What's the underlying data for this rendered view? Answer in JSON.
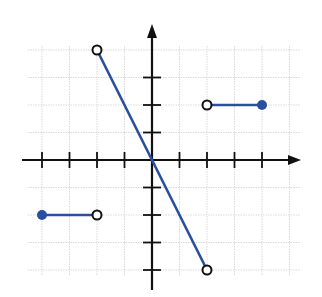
{
  "chart_data": {
    "type": "line",
    "title": "",
    "xlabel": "",
    "ylabel": "",
    "xlim": [
      -4,
      5
    ],
    "ylim": [
      -4,
      4
    ],
    "grid": true,
    "axis_ticks_x": [
      -4,
      -3,
      -2,
      -1,
      1,
      2,
      3,
      4
    ],
    "axis_ticks_y": [
      -4,
      -3,
      -2,
      -1,
      1,
      2,
      3
    ],
    "tick_labels_shown": false,
    "legend": [],
    "series": [
      {
        "name": "piece-1",
        "points": [
          [
            -4,
            -2
          ],
          [
            -2,
            -2
          ]
        ],
        "endpoints": [
          {
            "x": -4,
            "y": -2,
            "style": "closed"
          },
          {
            "x": -2,
            "y": -2,
            "style": "open"
          }
        ]
      },
      {
        "name": "piece-2",
        "points": [
          [
            -2,
            4
          ],
          [
            0,
            0
          ],
          [
            2,
            -4
          ]
        ],
        "endpoints": [
          {
            "x": -2,
            "y": 4,
            "style": "open"
          },
          {
            "x": 2,
            "y": -4,
            "style": "open"
          }
        ]
      },
      {
        "name": "piece-3",
        "points": [
          [
            2,
            2
          ],
          [
            4,
            2
          ]
        ],
        "endpoints": [
          {
            "x": 2,
            "y": 2,
            "style": "open"
          },
          {
            "x": 4,
            "y": 2,
            "style": "closed"
          }
        ]
      }
    ],
    "colors": {
      "line": "#2b4e9e",
      "axis": "#111111",
      "grid": "#d9d9d9",
      "open_point_stroke": "#111111",
      "open_point_fill": "#ffffff",
      "closed_point_fill": "#2b4e9e"
    },
    "layout": {
      "origin_px": [
        152,
        160
      ],
      "unit_px": 27.5,
      "grid_x_range": [
        -4,
        5
      ],
      "grid_y_range": [
        -4,
        4
      ],
      "x_axis_px": [
        22,
        301
      ],
      "y_axis_px": [
        24,
        290
      ]
    }
  }
}
